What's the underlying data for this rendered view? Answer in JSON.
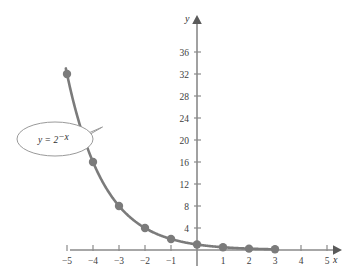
{
  "figure": {
    "title": "",
    "background_color": "#ffffff",
    "curve_color": "#7b7b7b",
    "axis_color": "#8a8a8a",
    "label_color": "#3d3d3d"
  },
  "axes": {
    "x_name": "x",
    "y_name": "y",
    "x_ticks": [
      "−5",
      "−4",
      "−3",
      "−2",
      "−1",
      "1",
      "2",
      "3",
      "4",
      "5"
    ],
    "x_tick_values": [
      -5,
      -4,
      -3,
      -2,
      -1,
      1,
      2,
      3,
      4,
      5
    ],
    "y_ticks": [
      "4",
      "8",
      "12",
      "16",
      "20",
      "24",
      "28",
      "32",
      "36"
    ],
    "y_tick_values": [
      4,
      8,
      12,
      16,
      20,
      24,
      28,
      32,
      36
    ]
  },
  "annotation": {
    "equation_lhs": "y = 2",
    "equation_exponent": "−x",
    "equation_full": "y = 2^−x"
  },
  "chart_data": {
    "type": "line",
    "title": "",
    "xlabel": "x",
    "ylabel": "y",
    "xlim": [
      -6,
      5.8
    ],
    "ylim": [
      -1,
      38
    ],
    "grid": false,
    "legend": "none",
    "annotations": [
      {
        "text": "y = 2^−x",
        "shape": "ellipse-callout",
        "points_to_x": -4.6,
        "points_to_y": 21.8
      }
    ],
    "xticks": [
      -5,
      -4,
      -3,
      -2,
      -1,
      1,
      2,
      3,
      4,
      5
    ],
    "yticks": [
      4,
      8,
      12,
      16,
      20,
      24,
      28,
      32,
      36
    ],
    "series": [
      {
        "name": "y = 2^-x",
        "marker": "filled-circle",
        "marker_color": "#7b7b7b",
        "line_color": "#7b7b7b",
        "x": [
          -5,
          -4,
          -3,
          -2,
          -1,
          0,
          1,
          2,
          3
        ],
        "values": [
          32,
          16,
          8,
          4,
          2,
          1,
          0.5,
          0.25,
          0.125
        ]
      }
    ]
  }
}
